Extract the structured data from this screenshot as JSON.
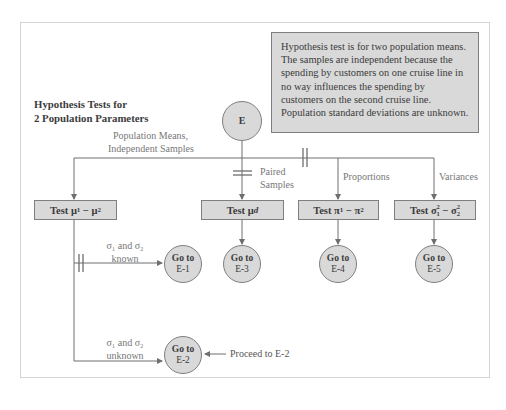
{
  "diagram": {
    "title_line1": "Hypothesis Tests for",
    "title_line2": "2 Population Parameters",
    "note": "Hypothesis test is for two population means. The samples are independent because the spending by customers on one cruise line in no way influences the spending by customers on the second cruise line. Population standard deviations are unknown.",
    "start_node": "E",
    "branches": {
      "means_independent_line1": "Population Means,",
      "means_independent_line2": "Independent Samples",
      "paired_line1": "Paired",
      "paired_line2": "Samples",
      "proportions": "Proportions",
      "variances": "Variances"
    },
    "tests": {
      "diff_means": {
        "prefix": "Test ",
        "sym1": "μ",
        "sub1": "1",
        "op": " − ",
        "sym2": "μ",
        "sub2": "2"
      },
      "paired": {
        "prefix": "Test ",
        "sym": "μ",
        "sub": "d"
      },
      "proportions": {
        "prefix": "Test ",
        "sym1": "π",
        "sub1": "1",
        "op": " − ",
        "sym2": "π",
        "sub2": "2"
      },
      "variances": {
        "prefix": "Test ",
        "sym1": "σ",
        "sup1": "2",
        "sub1": "1",
        "op": " − ",
        "sym2": "σ",
        "sup2": "2",
        "sub2": "2"
      }
    },
    "sigma_conditions": {
      "known_line1": "σ₁ and σ₂",
      "known_line2": "known",
      "unknown_line1": "σ₁ and σ₂",
      "unknown_line2": "unknown"
    },
    "goto": {
      "label": "Go to",
      "e1": "E-1",
      "e2": "E-2",
      "e3": "E-3",
      "e4": "E-4",
      "e5": "E-5"
    },
    "proceed": "Proceed to E-2",
    "colors": {
      "fill": "#d9d9d9",
      "stroke": "#7f7f7f",
      "line": "#6e6e6e",
      "label": "#777777"
    }
  }
}
